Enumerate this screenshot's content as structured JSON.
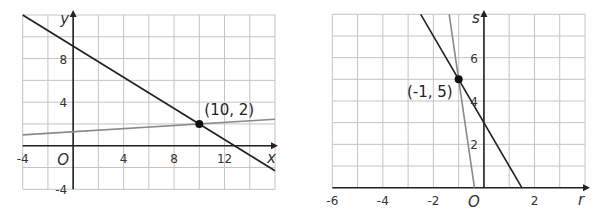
{
  "chart_data": [
    {
      "type": "line",
      "title": "",
      "xlabel": "x",
      "ylabel": "y",
      "origin_label": "O",
      "xlim": [
        -4,
        16
      ],
      "ylim": [
        -4,
        12
      ],
      "grid": true,
      "grid_step_x": 2,
      "grid_step_y": 2,
      "x_ticks": [
        -4,
        4,
        8,
        12
      ],
      "y_ticks": [
        8,
        4,
        -4
      ],
      "series": [
        {
          "name": "line-dark",
          "color": "#222222",
          "equation": "y = -5/7 x + 64/7",
          "points": [
            [
              -4,
              12
            ],
            [
              16,
              -2.29
            ]
          ]
        },
        {
          "name": "line-gray",
          "color": "#8a8a8a",
          "equation": "y = x/14 + 9/7",
          "points": [
            [
              -4,
              1
            ],
            [
              16,
              2.43
            ]
          ]
        }
      ],
      "intersection": {
        "x": 10,
        "y": 2,
        "label": "(10, 2)"
      }
    },
    {
      "type": "line",
      "title": "",
      "xlabel": "r",
      "ylabel": "s",
      "origin_label": "O",
      "xlim": [
        -6,
        4
      ],
      "ylim": [
        0,
        8
      ],
      "grid": true,
      "grid_step_x": 1,
      "grid_step_y": 1,
      "x_ticks": [
        -6,
        -4,
        -2,
        2
      ],
      "y_ticks": [
        6,
        4,
        2
      ],
      "series": [
        {
          "name": "line-dark",
          "color": "#222222",
          "equation": "s = -2r + 3",
          "points": [
            [
              -2.5,
              8
            ],
            [
              1.5,
              0
            ]
          ]
        },
        {
          "name": "line-gray",
          "color": "#8a8a8a",
          "equation": "s = -8r - 3",
          "points": [
            [
              -1.375,
              8
            ],
            [
              -0.375,
              0
            ]
          ]
        }
      ],
      "intersection": {
        "x": -1,
        "y": 5,
        "label": "(-1, 5)"
      }
    }
  ]
}
